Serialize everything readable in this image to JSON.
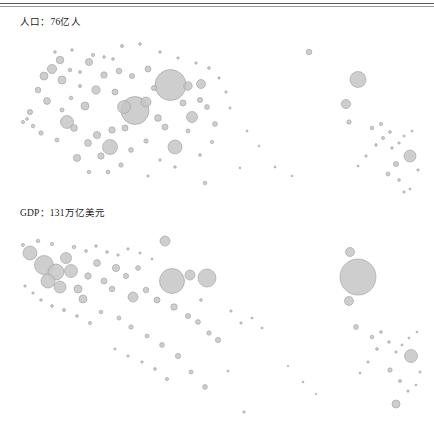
{
  "figure": {
    "type": "bubble-map-pair",
    "bubble_color": "#c6c6c6",
    "bubble_stroke": "#9d9d9d",
    "background": "#ffffff",
    "rule_color": "#5a5a5a"
  },
  "panels": {
    "population": {
      "label": "人口：76亿人",
      "metric": "population",
      "total_value": 76,
      "total_unit": "亿人"
    },
    "gdp": {
      "label": "GDP：131万亿美元",
      "metric": "gdp",
      "total_value": 131,
      "total_unit": "万亿美元"
    }
  },
  "footer": {
    "ghost1": "",
    "ghost2": "",
    "ghost3": ""
  },
  "chart_data": {
    "type": "scatter",
    "title": "",
    "xlabel": "",
    "ylabel": "",
    "grid": false,
    "legend": "none",
    "note": "Bubble area encodes the metric; positions are geographic (world map projection). Two stacked panels: top = population, bottom = GDP.",
    "panels": [
      {
        "name": "population",
        "label": "人口：76亿人",
        "total": "76亿人",
        "origin_y": 10,
        "bubbles": [
          [
            170.5,
            85.0,
            15.5
          ],
          [
            135.0,
            110.5,
            14.0
          ],
          [
            358.0,
            79.5,
            8.0
          ],
          [
            110.0,
            147.0,
            7.5
          ],
          [
            175.0,
            147.0,
            7.0
          ],
          [
            124.0,
            107.0,
            6.5
          ],
          [
            67.0,
            122.0,
            6.5
          ],
          [
            410.0,
            156.0,
            6.0
          ],
          [
            192.0,
            117.0,
            5.5
          ],
          [
            146.0,
            102.0,
            5.0
          ],
          [
            188.0,
            86.0,
            4.2
          ],
          [
            201.0,
            84.0,
            4.5
          ],
          [
            346.0,
            104.0,
            4.6
          ],
          [
            52.0,
            69.0,
            4.6
          ],
          [
            44.0,
            76.0,
            4.0
          ],
          [
            62.0,
            80.0,
            4.0
          ],
          [
            89.0,
            62.0,
            3.6
          ],
          [
            60.0,
            60.0,
            3.8
          ],
          [
            96.0,
            90.0,
            4.2
          ],
          [
            85.0,
            106.0,
            4.0
          ],
          [
            74.0,
            128.0,
            3.4
          ],
          [
            97.0,
            135.0,
            3.6
          ],
          [
            88.0,
            143.0,
            3.4
          ],
          [
            77.0,
            158.0,
            3.6
          ],
          [
            101.0,
            156.0,
            3.2
          ],
          [
            112.0,
            130.0,
            3.2
          ],
          [
            125.0,
            128.0,
            3.0
          ],
          [
            47.0,
            101.0,
            3.4
          ],
          [
            38.0,
            90.0,
            2.8
          ],
          [
            30.0,
            112.0,
            2.6
          ],
          [
            115.0,
            92.0,
            3.0
          ],
          [
            104.0,
            75.0,
            3.2
          ],
          [
            119.0,
            71.0,
            2.8
          ],
          [
            132.0,
            76.0,
            2.6
          ],
          [
            148.0,
            69.0,
            3.0
          ],
          [
            154.0,
            88.0,
            2.6
          ],
          [
            158.0,
            118.0,
            3.4
          ],
          [
            165.0,
            127.0,
            3.0
          ],
          [
            183.0,
            103.0,
            3.0
          ],
          [
            200.0,
            100.0,
            2.6
          ],
          [
            207.0,
            107.0,
            2.4
          ],
          [
            215.0,
            124.0,
            2.4
          ],
          [
            188.0,
            131.0,
            2.0
          ],
          [
            146.0,
            141.0,
            2.2
          ],
          [
            131.0,
            150.0,
            2.4
          ],
          [
            121.0,
            165.0,
            2.2
          ],
          [
            108.0,
            172.0,
            2.0
          ],
          [
            89.0,
            172.0,
            1.8
          ],
          [
            57.0,
            140.0,
            2.0
          ],
          [
            41.0,
            133.0,
            2.2
          ],
          [
            33.0,
            126.0,
            1.8
          ],
          [
            23.0,
            122.0,
            1.6
          ],
          [
            27.0,
            119.0,
            1.4
          ],
          [
            62.0,
            110.0,
            2.0
          ],
          [
            71.0,
            98.0,
            1.8
          ],
          [
            80.0,
            86.0,
            1.6
          ],
          [
            70.0,
            70.0,
            1.8
          ],
          [
            80.0,
            72.0,
            1.5
          ],
          [
            93.0,
            55.0,
            1.6
          ],
          [
            104.0,
            57.0,
            1.4
          ],
          [
            113.0,
            59.0,
            1.4
          ],
          [
            55.0,
            52.0,
            1.3
          ],
          [
            72.0,
            50.0,
            1.3
          ],
          [
            122.0,
            46.0,
            1.6
          ],
          [
            140.0,
            44.0,
            1.4
          ],
          [
            160.0,
            52.0,
            1.3
          ],
          [
            178.0,
            58.0,
            1.2
          ],
          [
            196.0,
            63.0,
            1.2
          ],
          [
            209.0,
            68.0,
            1.4
          ],
          [
            219.0,
            78.0,
            1.2
          ],
          [
            226.0,
            92.0,
            1.2
          ],
          [
            230.0,
            108.0,
            1.1
          ],
          [
            212.0,
            142.0,
            1.6
          ],
          [
            200.0,
            155.0,
            1.4
          ],
          [
            175.0,
            167.0,
            1.3
          ],
          [
            160.0,
            160.0,
            1.2
          ],
          [
            148.0,
            176.0,
            1.2
          ],
          [
            205.0,
            183.0,
            1.8
          ],
          [
            309.0,
            52.0,
            2.8
          ],
          [
            349.0,
            122.0,
            2.2
          ],
          [
            372.0,
            128.0,
            1.8
          ],
          [
            381.0,
            124.0,
            1.6
          ],
          [
            390.0,
            132.0,
            1.4
          ],
          [
            383.0,
            138.0,
            1.6
          ],
          [
            376.0,
            145.0,
            1.4
          ],
          [
            392.0,
            148.0,
            1.3
          ],
          [
            399.0,
            143.0,
            1.2
          ],
          [
            404.0,
            136.0,
            1.1
          ],
          [
            412.0,
            131.0,
            1.0
          ],
          [
            396.0,
            164.0,
            2.6
          ],
          [
            388.0,
            174.0,
            2.0
          ],
          [
            399.0,
            180.0,
            1.4
          ],
          [
            404.0,
            192.0,
            1.2
          ],
          [
            410.0,
            189.0,
            1.0
          ],
          [
            418.0,
            170.0,
            1.2
          ],
          [
            366.0,
            156.0,
            1.2
          ],
          [
            358.0,
            166.0,
            1.0
          ],
          [
            247.0,
            131.0,
            1.0
          ],
          [
            259.0,
            146.0,
            0.9
          ],
          [
            275.0,
            167.0,
            1.0
          ],
          [
            292.0,
            176.0,
            0.9
          ],
          [
            240.0,
            168.0,
            0.9
          ]
        ]
      },
      {
        "name": "gdp",
        "label": "GDP：131万亿美元",
        "total": "131万亿美元",
        "origin_y": 200,
        "bubbles": [
          [
            358.0,
            277.0,
            18.0
          ],
          [
            172.0,
            281.0,
            12.5
          ],
          [
            207.0,
            278.0,
            9.0
          ],
          [
            44.0,
            265.0,
            9.5
          ],
          [
            56.0,
            272.0,
            8.0
          ],
          [
            48.0,
            281.0,
            7.0
          ],
          [
            60.0,
            287.0,
            6.0
          ],
          [
            71.0,
            271.0,
            6.5
          ],
          [
            30.0,
            253.0,
            7.0
          ],
          [
            66.0,
            258.0,
            5.5
          ],
          [
            190.0,
            275.0,
            5.0
          ],
          [
            133.0,
            297.0,
            5.0
          ],
          [
            83.0,
            299.0,
            4.0
          ],
          [
            78.0,
            289.0,
            4.0
          ],
          [
            350.0,
            252.0,
            4.5
          ],
          [
            349.0,
            301.0,
            4.5
          ],
          [
            165.0,
            241.0,
            5.0
          ],
          [
            411.0,
            356.0,
            6.5
          ],
          [
            396.0,
            404.0,
            4.0
          ],
          [
            116.0,
            268.0,
            3.6
          ],
          [
            97.0,
            263.0,
            3.4
          ],
          [
            88.0,
            276.0,
            3.2
          ],
          [
            104.0,
            281.0,
            3.0
          ],
          [
            112.0,
            289.0,
            2.8
          ],
          [
            126.0,
            276.0,
            2.6
          ],
          [
            138.0,
            268.0,
            2.4
          ],
          [
            146.0,
            290.0,
            2.8
          ],
          [
            157.0,
            300.0,
            3.0
          ],
          [
            174.0,
            307.0,
            3.2
          ],
          [
            188.0,
            316.0,
            2.6
          ],
          [
            198.0,
            322.0,
            2.4
          ],
          [
            209.0,
            333.0,
            2.2
          ],
          [
            218.0,
            340.0,
            2.6
          ],
          [
            162.0,
            345.0,
            2.4
          ],
          [
            147.0,
            336.0,
            2.0
          ],
          [
            131.0,
            327.0,
            2.2
          ],
          [
            119.0,
            318.0,
            2.0
          ],
          [
            101.0,
            312.0,
            1.8
          ],
          [
            90.0,
            323.0,
            1.6
          ],
          [
            77.0,
            316.0,
            1.4
          ],
          [
            64.0,
            310.0,
            1.6
          ],
          [
            52.0,
            306.0,
            1.4
          ],
          [
            41.0,
            300.0,
            1.3
          ],
          [
            33.0,
            293.0,
            1.2
          ],
          [
            25.0,
            286.0,
            1.2
          ],
          [
            23.0,
            245.0,
            1.6
          ],
          [
            38.0,
            241.0,
            1.8
          ],
          [
            52.0,
            244.0,
            1.6
          ],
          [
            74.0,
            247.0,
            1.8
          ],
          [
            86.0,
            251.0,
            1.4
          ],
          [
            96.0,
            246.0,
            1.3
          ],
          [
            107.0,
            252.0,
            1.4
          ],
          [
            118.0,
            255.0,
            1.2
          ],
          [
            128.0,
            249.0,
            1.2
          ],
          [
            140.0,
            253.0,
            1.1
          ],
          [
            152.0,
            259.0,
            1.0
          ],
          [
            201.0,
            300.0,
            1.4
          ],
          [
            231.0,
            311.0,
            1.2
          ],
          [
            241.0,
            323.0,
            1.2
          ],
          [
            252.0,
            318.0,
            1.0
          ],
          [
            262.0,
            328.0,
            1.1
          ],
          [
            178.0,
            356.0,
            2.6
          ],
          [
            191.0,
            372.0,
            2.0
          ],
          [
            205.0,
            387.0,
            2.4
          ],
          [
            167.0,
            379.0,
            1.6
          ],
          [
            155.0,
            369.0,
            1.4
          ],
          [
            142.0,
            362.0,
            1.2
          ],
          [
            128.0,
            356.0,
            1.2
          ],
          [
            115.0,
            349.0,
            1.1
          ],
          [
            228.0,
            371.0,
            1.0
          ],
          [
            244.0,
            412.0,
            1.2
          ],
          [
            356.0,
            327.0,
            2.4
          ],
          [
            372.0,
            337.0,
            1.8
          ],
          [
            381.0,
            332.0,
            1.4
          ],
          [
            389.0,
            342.0,
            1.3
          ],
          [
            377.0,
            349.0,
            1.4
          ],
          [
            396.0,
            352.0,
            1.2
          ],
          [
            402.0,
            345.0,
            1.1
          ],
          [
            409.0,
            338.0,
            1.0
          ],
          [
            417.0,
            332.0,
            0.9
          ],
          [
            390.0,
            370.0,
            2.2
          ],
          [
            400.0,
            381.0,
            1.6
          ],
          [
            408.0,
            391.0,
            1.2
          ],
          [
            416.0,
            385.0,
            1.0
          ],
          [
            420.0,
            372.0,
            1.1
          ],
          [
            368.0,
            362.0,
            1.2
          ],
          [
            360.0,
            373.0,
            1.0
          ],
          [
            303.0,
            382.0,
            0.9
          ],
          [
            316.0,
            394.0,
            0.8
          ],
          [
            288.0,
            366.0,
            0.8
          ]
        ]
      }
    ]
  }
}
